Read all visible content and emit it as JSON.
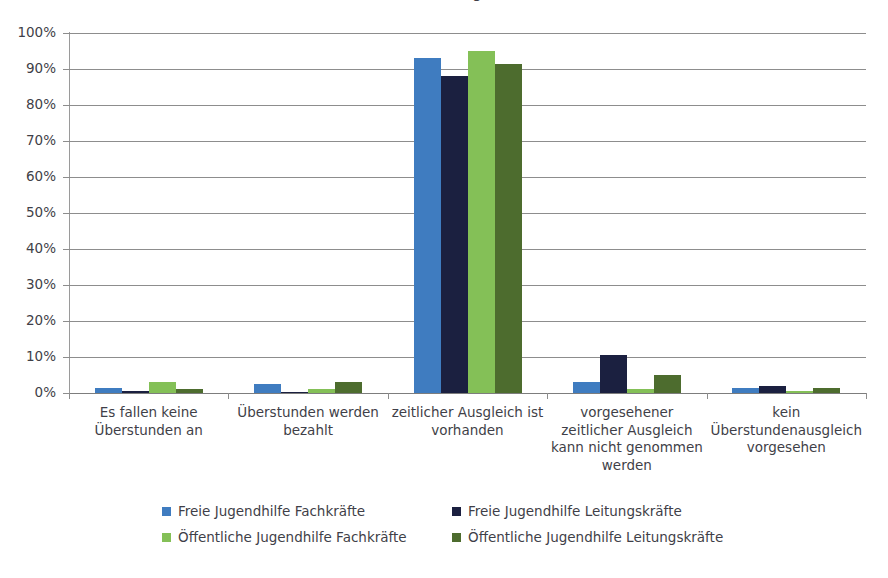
{
  "title_remnant": "Abbildung",
  "chart_data": {
    "type": "bar",
    "title": "",
    "xlabel": "",
    "ylabel": "",
    "ylim": [
      0,
      100
    ],
    "grid": true,
    "legend_position": "bottom",
    "ytick_labels": [
      "100%",
      "90%",
      "80%",
      "70%",
      "60%",
      "50%",
      "40%",
      "30%",
      "20%",
      "10%",
      "0%"
    ],
    "ytick_values": [
      100,
      90,
      80,
      70,
      60,
      50,
      40,
      30,
      20,
      10,
      0
    ],
    "categories": [
      "Es fallen keine\nÜberstunden an",
      "Überstunden werden\nbezahlt",
      "zeitlicher Ausgleich ist\nvorhanden",
      "vorgesehener\nzeitlicher Ausgleich\nkann nicht genommen\nwerden",
      "kein\nÜberstundenausgleich\nvorgesehen"
    ],
    "series": [
      {
        "name": "Freie Jugendhilfe Fachkräfte",
        "color": "#3f7cc0",
        "values": [
          1.5,
          2.5,
          93,
          3,
          1.5
        ]
      },
      {
        "name": "Freie Jugendhilfe Leitungskräfte",
        "color": "#1b2040",
        "values": [
          0.5,
          0.3,
          88,
          10.5,
          2
        ]
      },
      {
        "name": "Öffentliche Jugendhilfe Fachkräfte",
        "color": "#84c057",
        "values": [
          3,
          1,
          95,
          1,
          0.5
        ]
      },
      {
        "name": "Öffentliche Jugendhilfe Leitungskräfte",
        "color": "#4d6c2e",
        "values": [
          1,
          3,
          91.5,
          5,
          1.5
        ]
      }
    ]
  }
}
